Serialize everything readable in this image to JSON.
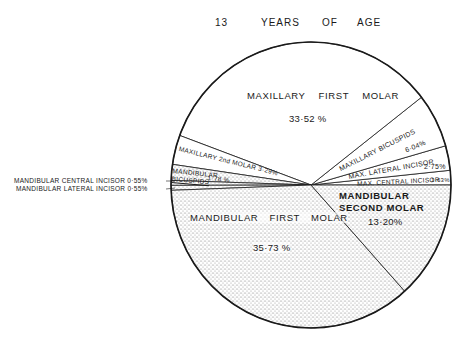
{
  "chart_data": {
    "type": "pie",
    "title_words": [
      "13",
      "YEARS",
      "OF",
      "AGE"
    ],
    "unit": "%",
    "start_angle_deg": 0,
    "direction": "counterclockwise",
    "slices": [
      {
        "label": "MAX. CENTRAL INCISOR",
        "value": 1.63,
        "display": "1.63%",
        "jaw": "maxillary",
        "fill": "white"
      },
      {
        "label": "MAX. LATERAL INCISOR",
        "value": 2.75,
        "display": "2.75%",
        "jaw": "maxillary",
        "fill": "white"
      },
      {
        "label": "MAXILLARY BICUSPIDS",
        "value": 6.04,
        "display": "6.04%",
        "jaw": "maxillary",
        "fill": "white"
      },
      {
        "label": "MAXILLARY FIRST MOLAR",
        "value": 33.52,
        "display": "33.52 %",
        "jaw": "maxillary",
        "fill": "white"
      },
      {
        "label": "MAXILLARY 2nd MOLAR",
        "value": 3.29,
        "display": "3.29%",
        "jaw": "maxillary",
        "fill": "white"
      },
      {
        "label": "MANDIBULAR BICUSPIDS",
        "value": 1.78,
        "display": "1.78 %",
        "jaw": "mandibular",
        "fill": "stipple"
      },
      {
        "label": "MANDIBULAR CENTRAL INCISOR",
        "value": 0.55,
        "display": "0.55%",
        "jaw": "mandibular",
        "fill": "stipple"
      },
      {
        "label": "MANDIBULAR LATERAL INCISOR",
        "value": 0.55,
        "display": "0.55%",
        "jaw": "mandibular",
        "fill": "stipple"
      },
      {
        "label": "MANDIBULAR FIRST MOLAR",
        "value": 35.73,
        "display": "35.73 %",
        "jaw": "mandibular",
        "fill": "stipple"
      },
      {
        "label": "MANDIBULAR SECOND MOLAR",
        "value": 13.2,
        "display": "13.20 %",
        "jaw": "mandibular",
        "fill": "stipple"
      }
    ],
    "legend": "none (labels placed inside/adjacent to slices)",
    "grid": false
  },
  "labels": {
    "max_first_molar": {
      "name": "MAXILLARY FIRST MOLAR",
      "pct": "33·52 %"
    },
    "max_bicuspids": {
      "name": "MAXILLARY BICUSPIDS",
      "pct": "6·04%"
    },
    "max_lateral_incisor": {
      "name": "MAX. LATERAL INCISOR",
      "pct": "2·75%"
    },
    "max_central_incisor": {
      "name": "MAX. CENTRAL INCISOR",
      "pct": "1·63%"
    },
    "max_second_molar": {
      "name": "MAXILLARY 2nd MOLAR 3·29%"
    },
    "mand_bicuspids": {
      "line1": "MANDIBULAR",
      "line2": "BICUSPIDS",
      "pct": "1·78 %"
    },
    "mand_central_incisor": {
      "name": "MANDIBULAR  CENTRAL  INCISOR  0·55%"
    },
    "mand_lateral_incisor": {
      "name": "MANDIBULAR  LATERAL  INCISOR  0·55%"
    },
    "mand_first_molar": {
      "name": "MANDIBULAR   FIRST   MOLAR",
      "pct": "35·73 %"
    },
    "mand_second_molar": {
      "line1": "MANDIBULAR",
      "line2": "SECOND  MOLAR",
      "pct": "13·20%"
    }
  },
  "colors": {
    "ink": "#1a1a1a",
    "paper": "#ffffff",
    "stipple": "#6b6b6b"
  }
}
